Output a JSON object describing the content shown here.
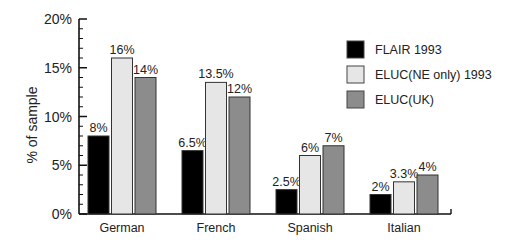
{
  "chart_data": {
    "type": "bar",
    "title": "",
    "xlabel": "",
    "ylabel": "% of sample",
    "ylim": [
      0,
      20
    ],
    "yticks": [
      "0%",
      "5%",
      "10%",
      "15%",
      "20%"
    ],
    "grid": false,
    "legend_position": "upper right",
    "categories": [
      "German",
      "French",
      "Spanish",
      "Italian"
    ],
    "series": [
      {
        "name": "FLAIR 1993",
        "color": "#000000",
        "values": [
          8,
          6.5,
          2.5,
          2
        ],
        "labels": [
          "8%",
          "6.5%",
          "2.5%",
          "2%"
        ]
      },
      {
        "name": "ELUC(NE only) 1993",
        "color": "#e6e6e6",
        "values": [
          16,
          13.5,
          6,
          3.3
        ],
        "labels": [
          "16%",
          "13.5%",
          "6%",
          "3.3%"
        ]
      },
      {
        "name": "ELUC(UK)",
        "color": "#8c8c8c",
        "values": [
          14,
          12,
          7,
          4
        ],
        "labels": [
          "14%",
          "12%",
          "7%",
          "4%"
        ]
      }
    ]
  }
}
